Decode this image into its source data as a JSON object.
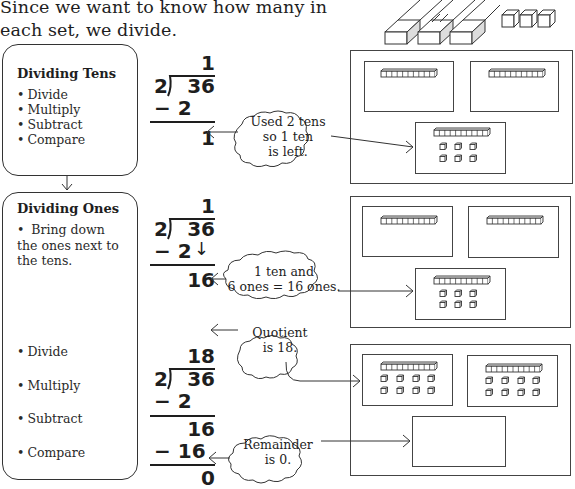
{
  "intro": {
    "line1": "Since we want to know how many in",
    "line2": "each set, we divide."
  },
  "steps": [
    {
      "title": "Dividing Tens",
      "bullets": [
        "Divide",
        "Multiply",
        "Subtract",
        "Compare"
      ]
    },
    {
      "title": "Dividing Ones",
      "bullets": [
        "Bring down the ones next to the tens.",
        "Divide",
        "Multiply",
        "Subtract",
        "Compare"
      ]
    }
  ],
  "division_1": {
    "quotient": "1",
    "divisor": "2",
    "dividend": "36",
    "minus": "− 2",
    "result": "1"
  },
  "division_2": {
    "quotient": "1",
    "divisor": "2",
    "dividend": "36",
    "minus": "− 2",
    "bring_down_arrow": "↓",
    "result": "16"
  },
  "division_3": {
    "quotient": "18",
    "divisor": "2",
    "dividend": "36",
    "minus1": "− 2",
    "partial": "16",
    "minus2": "− 16",
    "remainder": "0"
  },
  "callouts": {
    "tens_left": [
      "Used 2 tens",
      "so 1 ten",
      "is left."
    ],
    "regroup": [
      "1 ten and",
      "6 ones = 16 ones."
    ],
    "quotient": [
      "Quotient",
      "is 18."
    ],
    "remainder": [
      "Remainder",
      "is 0."
    ]
  },
  "illustration": {
    "top_image": "base-ten-blocks-tens-rods-and-ones",
    "panel_1": {
      "groups": [
        {
          "tens": 1,
          "ones": 0
        },
        {
          "tens": 1,
          "ones": 0
        }
      ],
      "leftover": {
        "tens": 1,
        "ones": 6
      }
    },
    "panel_2": {
      "groups": [
        {
          "tens": 1,
          "ones": 0
        },
        {
          "tens": 1,
          "ones": 0
        }
      ],
      "leftover": {
        "tens": 1,
        "ones": 6
      }
    },
    "panel_3": {
      "groups": [
        {
          "tens": 1,
          "ones": 8
        },
        {
          "tens": 1,
          "ones": 8
        }
      ],
      "leftover": {
        "tens": 0,
        "ones": 0
      }
    }
  }
}
